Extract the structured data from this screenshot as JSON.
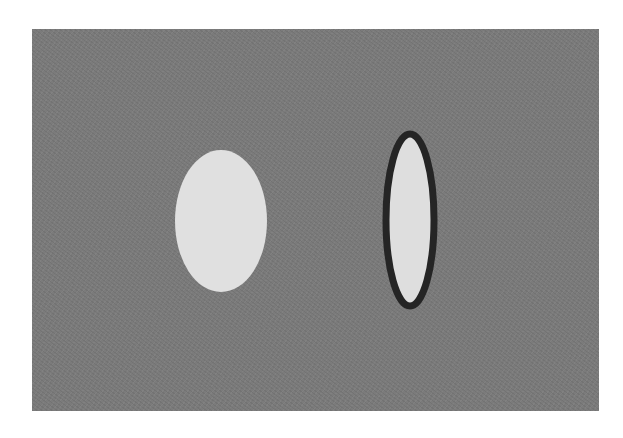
{
  "canvas": {
    "width": 623,
    "height": 438,
    "page_background": "#ffffff"
  },
  "panel": {
    "x": 32,
    "y": 29,
    "width": 567,
    "height": 382,
    "color": "#7b7b7b"
  },
  "shapes": [
    {
      "type": "ellipse",
      "name": "filled-ellipse",
      "cx": 221,
      "cy": 221,
      "rx": 46,
      "ry": 71,
      "fill": "#e0e0e0",
      "stroke": "none",
      "stroke_width": 0
    },
    {
      "type": "ellipse",
      "name": "outlined-ellipse",
      "cx": 410,
      "cy": 220,
      "rx": 24,
      "ry": 86,
      "fill": "#dedede",
      "stroke": "#252525",
      "stroke_width": 7
    }
  ]
}
